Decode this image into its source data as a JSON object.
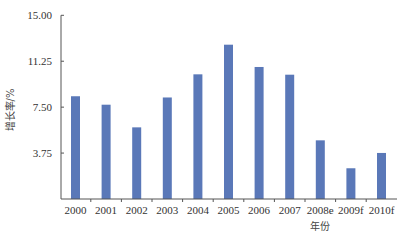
{
  "chart_data": {
    "type": "bar",
    "title": "",
    "xlabel": "年份",
    "ylabel": "增长率/%",
    "categories": [
      "2000",
      "2001",
      "2002",
      "2003",
      "2004",
      "2005",
      "2006",
      "2007",
      "2008e",
      "2009f",
      "2010f"
    ],
    "values": [
      8.39,
      7.7,
      5.85,
      8.29,
      10.18,
      12.6,
      10.78,
      10.15,
      4.79,
      2.51,
      3.76
    ],
    "ylim": [
      0,
      15
    ],
    "yticks": [
      "3.75",
      "7.50",
      "11.25",
      "15.00"
    ],
    "ytick_values": [
      3.75,
      7.5,
      11.25,
      15
    ],
    "grid": false,
    "legend": "none",
    "bar_color": "#5a78b8",
    "axis_color": "#555555"
  }
}
